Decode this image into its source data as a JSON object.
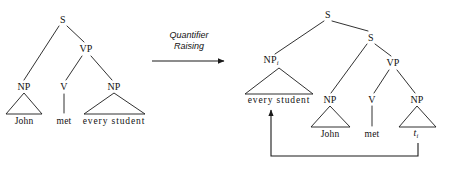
{
  "figure": {
    "operation": {
      "line1": "Quantifier",
      "line2": "Raising"
    },
    "ink_color": "#1a1a1a",
    "background_color": "#ffffff"
  },
  "left_tree": {
    "name": "d-structure-tree",
    "nodes": [
      {
        "label": "S",
        "x": 63,
        "y": 20
      },
      {
        "label": "VP",
        "x": 86,
        "y": 49
      },
      {
        "label": "NP",
        "x": 24,
        "y": 87
      },
      {
        "label": "V",
        "x": 64,
        "y": 87
      },
      {
        "label": "NP",
        "x": 114,
        "y": 87
      }
    ],
    "words": [
      {
        "label": "John",
        "x": 24,
        "y": 122
      },
      {
        "label": "met",
        "x": 64,
        "y": 122
      },
      {
        "label": "every student",
        "x": 114,
        "y": 122
      }
    ]
  },
  "right_tree": {
    "name": "lf-structure-tree",
    "nodes": [
      {
        "label": "S",
        "sub": "",
        "x": 328,
        "y": 15
      },
      {
        "label": "S",
        "sub": "",
        "x": 371,
        "y": 38
      },
      {
        "label": "NP",
        "sub": "i",
        "x": 271,
        "y": 61
      },
      {
        "label": "VP",
        "sub": "",
        "x": 393,
        "y": 63
      },
      {
        "label": "NP",
        "sub": "",
        "x": 330,
        "y": 100
      },
      {
        "label": "V",
        "sub": "",
        "x": 372,
        "y": 100
      },
      {
        "label": "NP",
        "sub": "",
        "x": 417,
        "y": 100
      }
    ],
    "words": [
      {
        "label": "every student",
        "x": 279,
        "y": 101,
        "italic": false
      },
      {
        "label": "John",
        "x": 330,
        "y": 135,
        "italic": false
      },
      {
        "label": "met",
        "x": 372,
        "y": 135,
        "italic": false
      }
    ],
    "trace": {
      "label": "t",
      "sub": "i",
      "x": 416,
      "y": 134
    }
  },
  "movement_arrow": {
    "name": "qr-movement-arrow",
    "from_x": 418,
    "from_y": 143,
    "bottom_y": 156,
    "to_x": 271,
    "to_y": 107
  }
}
